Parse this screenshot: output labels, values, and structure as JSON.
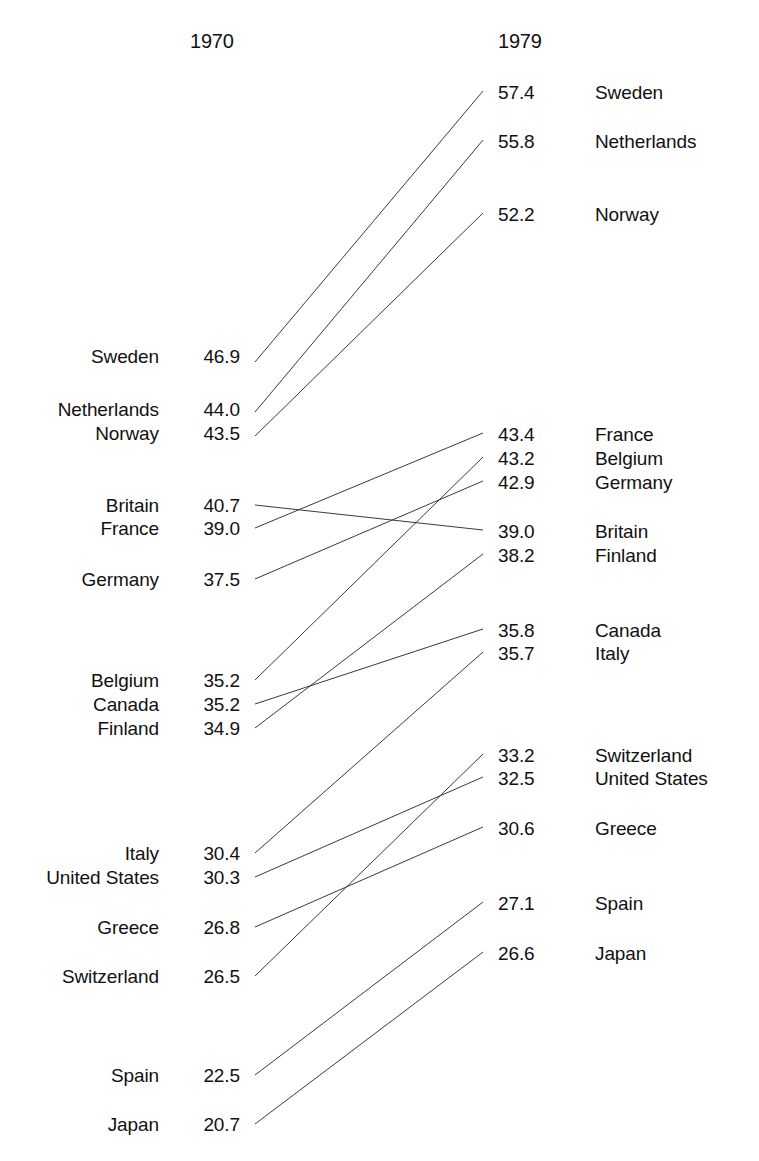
{
  "figure": {
    "type": "slopegraph",
    "left_header": "1970",
    "right_header": "1979",
    "line_color": "#3a3a3a",
    "background_color": "#ffffff",
    "text_color": "#111111"
  },
  "chart_data": {
    "type": "line",
    "title": "",
    "subtitle": "",
    "xlabel": "",
    "ylabel": "",
    "categories": [
      "1970",
      "1979"
    ],
    "grid": false,
    "legend_position": "none",
    "axis_note": "Two-column slopegraph; vertical position encodes value",
    "series": [
      {
        "name": "Sweden",
        "values": [
          46.9,
          57.4
        ]
      },
      {
        "name": "Netherlands",
        "values": [
          44.0,
          55.8
        ]
      },
      {
        "name": "Norway",
        "values": [
          43.5,
          52.2
        ]
      },
      {
        "name": "Britain",
        "values": [
          40.7,
          39.0
        ]
      },
      {
        "name": "France",
        "values": [
          39.0,
          43.4
        ]
      },
      {
        "name": "Germany",
        "values": [
          37.5,
          42.9
        ]
      },
      {
        "name": "Belgium",
        "values": [
          35.2,
          43.2
        ]
      },
      {
        "name": "Canada",
        "values": [
          35.2,
          35.8
        ]
      },
      {
        "name": "Finland",
        "values": [
          34.9,
          38.2
        ]
      },
      {
        "name": "Italy",
        "values": [
          30.4,
          35.7
        ]
      },
      {
        "name": "United States",
        "values": [
          30.3,
          32.5
        ]
      },
      {
        "name": "Greece",
        "values": [
          26.8,
          30.6
        ]
      },
      {
        "name": "Switzerland",
        "values": [
          26.5,
          33.2
        ]
      },
      {
        "name": "Spain",
        "values": [
          22.5,
          27.1
        ]
      },
      {
        "name": "Japan",
        "values": [
          20.7,
          26.6
        ]
      }
    ]
  },
  "left_column": {
    "header": "1970",
    "rows": [
      {
        "name": "Sweden",
        "value": "46.9",
        "y": 362
      },
      {
        "name": "Netherlands",
        "value": "44.0",
        "y": 415
      },
      {
        "name": "Norway",
        "value": "43.5",
        "y": 439
      },
      {
        "name": "Britain",
        "value": "40.7",
        "y": 511
      },
      {
        "name": "France",
        "value": "39.0",
        "y": 534
      },
      {
        "name": "Germany",
        "value": "37.5",
        "y": 585
      },
      {
        "name": "Belgium",
        "value": "35.2",
        "y": 686
      },
      {
        "name": "Canada",
        "value": "35.2",
        "y": 710
      },
      {
        "name": "Finland",
        "value": "34.9",
        "y": 734
      },
      {
        "name": "Italy",
        "value": "30.4",
        "y": 859
      },
      {
        "name": "United States",
        "value": "30.3",
        "y": 883
      },
      {
        "name": "Greece",
        "value": "26.8",
        "y": 933
      },
      {
        "name": "Switzerland",
        "value": "26.5",
        "y": 982
      },
      {
        "name": "Spain",
        "value": "22.5",
        "y": 1081
      },
      {
        "name": "Japan",
        "value": "20.7",
        "y": 1130
      }
    ]
  },
  "right_column": {
    "header": "1979",
    "rows": [
      {
        "value": "57.4",
        "name": "Sweden",
        "y": 98
      },
      {
        "value": "55.8",
        "name": "Netherlands",
        "y": 147
      },
      {
        "value": "52.2",
        "name": "Norway",
        "y": 220
      },
      {
        "value": "43.4",
        "name": "France",
        "y": 440
      },
      {
        "value": "43.2",
        "name": "Belgium",
        "y": 464
      },
      {
        "value": "42.9",
        "name": "Germany",
        "y": 488
      },
      {
        "value": "39.0",
        "name": "Britain",
        "y": 537
      },
      {
        "value": "38.2",
        "name": "Finland",
        "y": 561
      },
      {
        "value": "35.8",
        "name": "Canada",
        "y": 636
      },
      {
        "value": "35.7",
        "name": "Italy",
        "y": 659
      },
      {
        "value": "33.2",
        "name": "Switzerland",
        "y": 761
      },
      {
        "value": "32.5",
        "name": "United States",
        "y": 784
      },
      {
        "value": "30.6",
        "name": "Greece",
        "y": 834
      },
      {
        "value": "27.1",
        "name": "Spain",
        "y": 909
      },
      {
        "value": "26.6",
        "name": "Japan",
        "y": 959
      }
    ]
  },
  "lines": [
    {
      "name": "Sweden",
      "x1": 255,
      "y1": 362,
      "x2": 483,
      "y2": 91
    },
    {
      "name": "Netherlands",
      "x1": 255,
      "y1": 412,
      "x2": 483,
      "y2": 140
    },
    {
      "name": "Norway",
      "x1": 255,
      "y1": 436,
      "x2": 483,
      "y2": 213
    },
    {
      "name": "Britain",
      "x1": 255,
      "y1": 505,
      "x2": 483,
      "y2": 530
    },
    {
      "name": "France",
      "x1": 255,
      "y1": 528,
      "x2": 483,
      "y2": 433
    },
    {
      "name": "Germany",
      "x1": 255,
      "y1": 579,
      "x2": 483,
      "y2": 481
    },
    {
      "name": "Belgium",
      "x1": 255,
      "y1": 680,
      "x2": 483,
      "y2": 457
    },
    {
      "name": "Canada",
      "x1": 255,
      "y1": 704,
      "x2": 483,
      "y2": 629
    },
    {
      "name": "Finland",
      "x1": 255,
      "y1": 728,
      "x2": 483,
      "y2": 554
    },
    {
      "name": "Italy",
      "x1": 255,
      "y1": 853,
      "x2": 483,
      "y2": 652
    },
    {
      "name": "United States",
      "x1": 255,
      "y1": 877,
      "x2": 483,
      "y2": 777
    },
    {
      "name": "Greece",
      "x1": 255,
      "y1": 927,
      "x2": 483,
      "y2": 827
    },
    {
      "name": "Switzerland",
      "x1": 255,
      "y1": 976,
      "x2": 483,
      "y2": 754
    },
    {
      "name": "Spain",
      "x1": 255,
      "y1": 1075,
      "x2": 483,
      "y2": 902
    },
    {
      "name": "Japan",
      "x1": 255,
      "y1": 1124,
      "x2": 483,
      "y2": 952
    }
  ]
}
